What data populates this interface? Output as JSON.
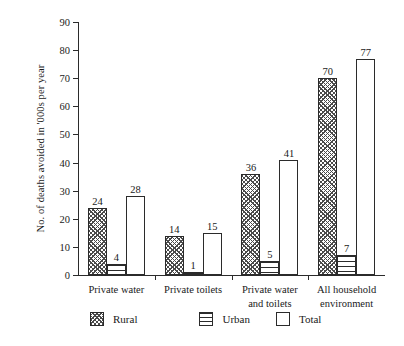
{
  "chart_data": {
    "type": "bar",
    "title": "",
    "xlabel": "",
    "ylabel": "No. of deaths avoided in '000s per year",
    "ylim": [
      0,
      90
    ],
    "ytick_step": 10,
    "yticks": [
      "0",
      "10",
      "20",
      "30",
      "40",
      "50",
      "60",
      "70",
      "80",
      "90"
    ],
    "grid": false,
    "legend_position": "bottom",
    "categories": [
      "Private water",
      "Private toilets",
      "Private water and toilets",
      "All household environment"
    ],
    "category_lines": [
      [
        "Private water"
      ],
      [
        "Private toilets"
      ],
      [
        "Private water",
        "and toilets"
      ],
      [
        "All household",
        "environment"
      ]
    ],
    "series": [
      {
        "name": "Rural",
        "pattern": "diagonal-crosshatch",
        "values": [
          24,
          14,
          36,
          70
        ]
      },
      {
        "name": "Urban",
        "pattern": "horizontal-lines",
        "values": [
          4,
          1,
          5,
          7
        ]
      },
      {
        "name": "Total",
        "pattern": "empty-white",
        "values": [
          28,
          15,
          41,
          77
        ]
      }
    ]
  },
  "colors": {
    "stroke": "#2b2b2b",
    "background": "#ffffff",
    "hatch": "#4a4a4a"
  }
}
